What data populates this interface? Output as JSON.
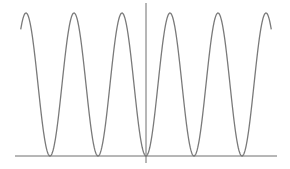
{
  "chart_data": {
    "type": "line",
    "title": "",
    "xlabel": "",
    "ylabel": "",
    "function": "y = sin^2(x)",
    "xlim": [
      -8.2,
      8.2
    ],
    "ylim": [
      0,
      1
    ],
    "grid": false,
    "legend": "none",
    "series": [
      {
        "name": "sin^2(x)",
        "color": "#7a7a7a",
        "x": [
          -8.2,
          -7.854,
          -6.283,
          -4.712,
          -3.142,
          -1.571,
          0,
          1.571,
          3.142,
          4.712,
          6.283,
          7.854,
          8.2
        ],
        "y": [
          0.89,
          1,
          0,
          1,
          0,
          1,
          0,
          1,
          0,
          1,
          0,
          1,
          0.89
        ]
      }
    ],
    "axes_color": "#6e6e6e"
  }
}
